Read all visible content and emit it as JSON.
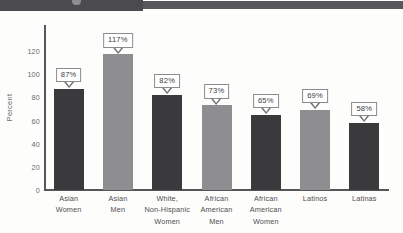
{
  "header": {
    "strip_color_left": "#4b4b4d",
    "strip_color_right": "#58585a"
  },
  "chart_data": {
    "type": "bar",
    "title": "",
    "xlabel": "",
    "ylabel": "Percent",
    "ylim": [
      0,
      130
    ],
    "yticks": [
      0,
      20,
      40,
      60,
      80,
      100,
      120
    ],
    "ytick_labels": [
      "0",
      "20",
      "40",
      "60",
      "80",
      "100",
      "120"
    ],
    "grid": false,
    "legend": "none",
    "categories": [
      "Asian\nWomen",
      "Asian\nMen",
      "White,\nNon-Hispanic\nWomen",
      "African\nAmerican\nMen",
      "African\nAmerican\nWomen",
      "Latinos",
      "Latinas"
    ],
    "values": [
      87,
      117,
      82,
      73,
      65,
      69,
      58
    ],
    "data_labels": [
      "87%",
      "117%",
      "82%",
      "73%",
      "65%",
      "69%",
      "58%"
    ],
    "bar_colors": [
      "#3a3a3d",
      "#8e8e90",
      "#3a3a3d",
      "#8e8e90",
      "#3a3a3d",
      "#8e8e90",
      "#3a3a3d"
    ]
  },
  "categories_lines": [
    [
      "Asian",
      "Women"
    ],
    [
      "Asian",
      "Men"
    ],
    [
      "White,",
      "Non-Hispanic",
      "Women"
    ],
    [
      "African",
      "American",
      "Men"
    ],
    [
      "African",
      "American",
      "Women"
    ],
    [
      "Latinos"
    ],
    [
      "Latinas"
    ]
  ]
}
